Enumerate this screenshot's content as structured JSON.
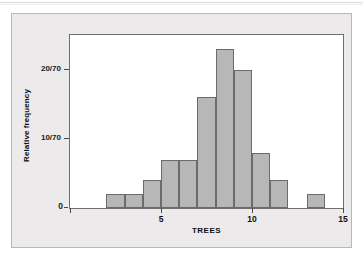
{
  "figure": {
    "background_color": "#eceaea",
    "plot_background_color": "#ffffff",
    "frame_color": "#6f6f6f",
    "bar_fill_color": "#b7b7b7",
    "bar_edge_color": "#6b6b6b"
  },
  "chart_data": {
    "type": "bar",
    "title": "",
    "subtitle": "",
    "xlabel": "TREES",
    "ylabel": "Relative frequency",
    "xlim": [
      0,
      15
    ],
    "ylim": [
      0,
      25
    ],
    "grid": false,
    "legend": null,
    "x_ticks": [
      0,
      5,
      10,
      15
    ],
    "x_tick_labels": [
      "0",
      "5",
      "10",
      "15"
    ],
    "y_ticks": [
      0,
      10,
      20
    ],
    "y_tick_labels": [
      "0",
      "10/70",
      "20/70"
    ],
    "bin_width": 1,
    "total_count": 70,
    "bin_starts": [
      2,
      3,
      4,
      5,
      6,
      7,
      8,
      9,
      10,
      11,
      13
    ],
    "bin_ends": [
      3,
      4,
      5,
      6,
      7,
      8,
      9,
      10,
      11,
      12,
      14
    ],
    "bin_labels": [
      "2-3",
      "3-4",
      "4-5",
      "5-6",
      "6-7",
      "7-8",
      "8-9",
      "9-10",
      "10-11",
      "11-12",
      "13-14"
    ],
    "counts": [
      2,
      2,
      4,
      7,
      7,
      16,
      23,
      20,
      8,
      4,
      2
    ],
    "relative_frequencies": [
      "2/70",
      "2/70",
      "4/70",
      "7/70",
      "7/70",
      "16/70",
      "23/70",
      "20/70",
      "8/70",
      "4/70",
      "2/70"
    ],
    "values": [
      2,
      2,
      4,
      7,
      7,
      16,
      23,
      20,
      8,
      4,
      2
    ],
    "categories": [
      "2-3",
      "3-4",
      "4-5",
      "5-6",
      "6-7",
      "7-8",
      "8-9",
      "9-10",
      "10-11",
      "11-12",
      "13-14"
    ]
  }
}
